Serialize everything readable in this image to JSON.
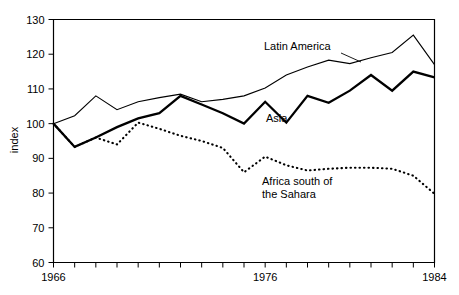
{
  "chart_data": {
    "type": "line",
    "title": "",
    "xlabel": "",
    "ylabel": "index",
    "xlim": [
      1966,
      1984
    ],
    "ylim": [
      60,
      130
    ],
    "grid": false,
    "legend_position": "inline-annotations",
    "x": [
      1966,
      1967,
      1968,
      1969,
      1970,
      1971,
      1972,
      1973,
      1974,
      1975,
      1976,
      1977,
      1978,
      1979,
      1980,
      1981,
      1982,
      1983,
      1984
    ],
    "ytick_labels": [
      "60",
      "70",
      "80",
      "90",
      "100",
      "110",
      "120",
      "130"
    ],
    "ytick_values": [
      60,
      70,
      80,
      90,
      100,
      110,
      120,
      130
    ],
    "xtick_labels": [
      "1966",
      "1976",
      "1984"
    ],
    "xtick_values": [
      1966,
      1976,
      1984
    ],
    "series": [
      {
        "name": "Latin America",
        "style": "thin-solid",
        "label": "Latin America",
        "values": [
          100.0,
          102.3,
          108.0,
          104.0,
          106.3,
          107.5,
          108.5,
          106.3,
          107.0,
          108.0,
          110.3,
          114.0,
          116.3,
          118.3,
          117.3,
          119.0,
          120.5,
          125.5,
          117.0
        ]
      },
      {
        "name": "Asia",
        "style": "thick-solid",
        "label": "Asia",
        "values": [
          100.0,
          93.3,
          96.0,
          99.0,
          101.5,
          103.0,
          108.0,
          105.5,
          103.0,
          100.0,
          106.3,
          100.3,
          108.0,
          106.0,
          109.5,
          114.0,
          109.5,
          115.0,
          113.3
        ]
      },
      {
        "name": "Africa south of the Sahara",
        "style": "dotted",
        "label_line1": "Africa south of",
        "label_line2": "the Sahara",
        "values": [
          100.0,
          93.3,
          96.0,
          94.0,
          100.3,
          98.5,
          96.5,
          95.0,
          93.0,
          86.0,
          90.5,
          88.0,
          86.5,
          87.0,
          87.3,
          87.3,
          87.0,
          85.0,
          79.8
        ]
      }
    ]
  },
  "annotations": {
    "latin_america": "Latin America",
    "asia": "Asia",
    "africa_line1": "Africa south of",
    "africa_line2": "the Sahara"
  }
}
